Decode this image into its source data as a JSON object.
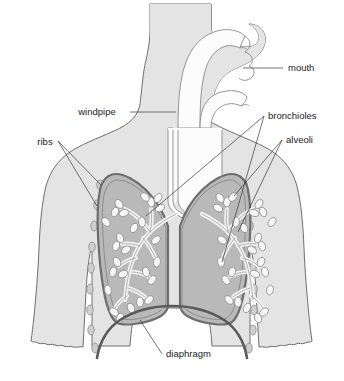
{
  "diagram": {
    "background_color": "#ffffff",
    "colors": {
      "body_fill": "#e4e4e4",
      "body_outline": "#6f6f6f",
      "lung_fill": "#b9b9b9",
      "lung_outline": "#6e6e6e",
      "lung_inner_outline": "#8c8c8c",
      "airway_fill": "#fcfcfc",
      "airway_outline": "#8a8a8a",
      "bronchi_fill": "#f2f2f2",
      "bronchi_outline": "#9a9a9a",
      "alveoli_fill": "#f6f6f6",
      "alveoli_outline": "#8f8f8f",
      "rib_fill": "#cfcfcf",
      "rib_outline": "#8a8a8a",
      "diaphragm_stroke": "#5a5a5a",
      "leader_line": "#3a3a3a",
      "label_text": "#1b1b1b"
    },
    "labels": [
      {
        "id": "mouth",
        "text": "mouth",
        "x": 288,
        "y": 71,
        "anchor": "start"
      },
      {
        "id": "windpipe",
        "text": "windpipe",
        "x": 100,
        "y": 115,
        "anchor": "middle"
      },
      {
        "id": "bronchioles",
        "text": "bronchioles",
        "x": 268,
        "y": 119,
        "anchor": "start"
      },
      {
        "id": "alveoli",
        "text": "alveoli",
        "x": 286,
        "y": 143,
        "anchor": "start"
      },
      {
        "id": "ribs",
        "text": "ribs",
        "x": 45,
        "y": 145,
        "anchor": "middle"
      },
      {
        "id": "diaphragm",
        "text": "diaphragm",
        "x": 166,
        "y": 357,
        "anchor": "start"
      }
    ],
    "structures": [
      {
        "id": "body",
        "name": "human torso and head silhouette"
      },
      {
        "id": "trachea",
        "name": "windpipe / trachea"
      },
      {
        "id": "nasal-oral",
        "name": "nasal and oral cavity airway"
      },
      {
        "id": "left-lung",
        "name": "left lung"
      },
      {
        "id": "right-lung",
        "name": "right lung"
      },
      {
        "id": "bronchial-tree",
        "name": "bronchi and bronchioles branching network"
      },
      {
        "id": "alveoli-clusters",
        "name": "alveoli sacs"
      },
      {
        "id": "ribs",
        "name": "rib cage segments"
      },
      {
        "id": "diaphragm",
        "name": "diaphragm muscle"
      }
    ]
  }
}
